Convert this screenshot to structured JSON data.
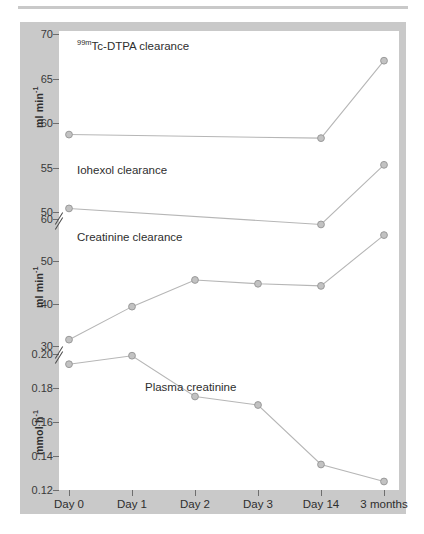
{
  "figure": {
    "background_color": "#c9c9c9",
    "plot_background_color": "#ffffff",
    "line_color": "#b6b6b6",
    "marker_color": "#c2c2c2"
  },
  "axes": {
    "y1": {
      "label": "ml min",
      "label_exp": "-1",
      "ticks": [
        "70",
        "65",
        "60",
        "55",
        "50"
      ]
    },
    "y2": {
      "label": "ml min",
      "label_exp": "-1",
      "ticks": [
        "60",
        "50",
        "40",
        "30"
      ]
    },
    "y3": {
      "label": "mmol h",
      "label_exp": "-1",
      "ticks": [
        "0.20",
        "0.18",
        "0.16",
        "0.14",
        "0.12"
      ]
    },
    "x": {
      "ticks": [
        "Day 0",
        "Day 1",
        "Day 2",
        "Day 3",
        "Day 14",
        "3 months"
      ]
    }
  },
  "series_labels": {
    "tc_dtpa_pre": "99m",
    "tc_dtpa": "Tc-DTPA clearance",
    "iohexol": "Iohexol clearance",
    "creatinine_clearance": "Creatinine clearance",
    "plasma_creatinine": "Plasma creatinine"
  },
  "chart_data": {
    "type": "line",
    "title": "",
    "xlabel": "",
    "ylabel": "",
    "grid": false,
    "legend_position": "in-plot annotations",
    "x": [
      "Day 0",
      "Day 1",
      "Day 2",
      "Day 3",
      "Day 14",
      "3 months"
    ],
    "panels": [
      {
        "name": "Tc-DTPA / Iohexol clearance panel",
        "ylabel": "ml min-1",
        "ylim": [
          50,
          70
        ],
        "yticks": [
          50,
          55,
          60,
          65,
          70
        ],
        "axis_break_below": true
      },
      {
        "name": "Creatinine clearance panel",
        "ylabel": "ml min-1",
        "ylim": [
          30,
          60
        ],
        "yticks": [
          30,
          40,
          50,
          60
        ],
        "axis_break_below": true
      },
      {
        "name": "Plasma creatinine panel",
        "ylabel": "mmol h-1",
        "ylim": [
          0.12,
          0.2
        ],
        "yticks": [
          0.12,
          0.14,
          0.16,
          0.18,
          0.2
        ]
      }
    ],
    "series": [
      {
        "name": "99mTc-DTPA clearance",
        "unit": "ml min-1",
        "panel": 0,
        "x": [
          "Day 0",
          "Day 14",
          "3 months"
        ],
        "values": [
          58.7,
          58.3,
          67.0
        ]
      },
      {
        "name": "Iohexol clearance",
        "unit": "ml min-1",
        "panel": 0,
        "x": [
          "Day 0",
          "Day 14",
          "3 months"
        ],
        "values": [
          50.4,
          48.6,
          55.3
        ]
      },
      {
        "name": "Creatinine clearance",
        "unit": "ml min-1",
        "panel": 1,
        "x": [
          "Day 0",
          "Day 1",
          "Day 2",
          "Day 3",
          "Day 14",
          "3 months"
        ],
        "values": [
          31.5,
          39.3,
          45.6,
          44.7,
          44.2,
          56.2
        ]
      },
      {
        "name": "Plasma creatinine",
        "unit": "mmol h-1",
        "panel": 2,
        "x": [
          "Day 0",
          "Day 1",
          "Day 2",
          "Day 3",
          "Day 14",
          "3 months"
        ],
        "values": [
          0.194,
          0.199,
          0.175,
          0.17,
          0.135,
          0.125
        ]
      }
    ]
  }
}
